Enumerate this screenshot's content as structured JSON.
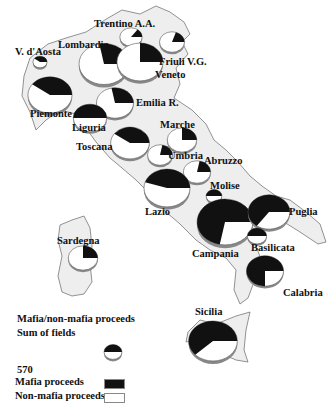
{
  "colors": {
    "mafia": "#111111",
    "non_mafia": "#ffffff",
    "land": "#eeeeee",
    "border": "#777777",
    "shadow": "#888888"
  },
  "legend": {
    "title": "Mafia/non-mafia proceeds",
    "subtitle": "Sum of fields",
    "reference_value": "570",
    "mafia_label": "Mafia proceeds",
    "non_mafia_label": "Non-mafia proceeds"
  },
  "chart_data": {
    "type": "pie",
    "title": "Mafia/non-mafia proceeds",
    "subtitle": "Sum of fields",
    "legend": [
      "Mafia proceeds",
      "Non-mafia proceeds"
    ],
    "reference_size": 570,
    "regions": [
      {
        "name": "Lombardia",
        "relative_size": 1.0,
        "mafia_share": 0.28
      },
      {
        "name": "Trentino A.A.",
        "relative_size": 0.2,
        "mafia_share": 0.15
      },
      {
        "name": "V. d'Aosta",
        "relative_size": 0.08,
        "mafia_share": 0.4
      },
      {
        "name": "Friuli V.G.",
        "relative_size": 0.25,
        "mafia_share": 0.2
      },
      {
        "name": "Veneto",
        "relative_size": 0.85,
        "mafia_share": 0.25
      },
      {
        "name": "Piemonte",
        "relative_size": 0.78,
        "mafia_share": 0.4
      },
      {
        "name": "Emilia R.",
        "relative_size": 0.55,
        "mafia_share": 0.28
      },
      {
        "name": "Liguria",
        "relative_size": 0.45,
        "mafia_share": 0.5
      },
      {
        "name": "Toscana",
        "relative_size": 0.6,
        "mafia_share": 0.4
      },
      {
        "name": "Marche",
        "relative_size": 0.35,
        "mafia_share": 0.25
      },
      {
        "name": "Umbria",
        "relative_size": 0.25,
        "mafia_share": 0.22
      },
      {
        "name": "Abruzzo",
        "relative_size": 0.3,
        "mafia_share": 0.22
      },
      {
        "name": "Lazio",
        "relative_size": 0.85,
        "mafia_share": 0.45
      },
      {
        "name": "Molise",
        "relative_size": 0.1,
        "mafia_share": 0.5
      },
      {
        "name": "Campania",
        "relative_size": 1.25,
        "mafia_share": 0.72
      },
      {
        "name": "Puglia",
        "relative_size": 0.7,
        "mafia_share": 0.65
      },
      {
        "name": "Basilicata",
        "relative_size": 0.15,
        "mafia_share": 0.5
      },
      {
        "name": "Calabria",
        "relative_size": 0.55,
        "mafia_share": 0.75
      },
      {
        "name": "Sicilia",
        "relative_size": 0.95,
        "mafia_share": 0.62
      },
      {
        "name": "Sardegna",
        "relative_size": 0.35,
        "mafia_share": 0.25
      }
    ]
  }
}
